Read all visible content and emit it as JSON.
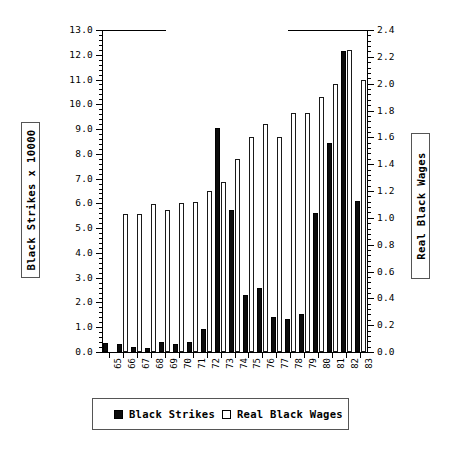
{
  "chart_data": {
    "type": "bar",
    "title": "",
    "subtitle": "",
    "xlabel": "",
    "ylabel": "Black Strikes x 10000",
    "ylabel_right": "Real Black Wages",
    "categories": [
      "65",
      "66",
      "67",
      "68",
      "69",
      "70",
      "71",
      "72",
      "73",
      "74",
      "75",
      "76",
      "77",
      "78",
      "79",
      "80",
      "81",
      "82",
      "83"
    ],
    "ylim": [
      0.0,
      13.0
    ],
    "ylim_right": [
      0.0,
      2.4
    ],
    "ytick_labels": [
      "0.0",
      "1.0",
      "2.0",
      "3.0",
      "4.0",
      "5.0",
      "6.0",
      "7.0",
      "8.0",
      "9.0",
      "10.0",
      "11.0",
      "12.0",
      "13.0"
    ],
    "ytick_values": [
      0,
      1,
      2,
      3,
      4,
      5,
      6,
      7,
      8,
      9,
      10,
      11,
      12,
      13
    ],
    "ytick_right_labels": [
      "0.0",
      "0.2",
      "0.4",
      "0.6",
      "0.8",
      "1.0",
      "1.2",
      "1.4",
      "1.6",
      "1.8",
      "2.0",
      "2.2",
      "2.4"
    ],
    "ytick_right_values": [
      0,
      0.2,
      0.4,
      0.6,
      0.8,
      1.0,
      1.2,
      1.4,
      1.6,
      1.8,
      2.0,
      2.2,
      2.4
    ],
    "minor_ticks_per_major": 5,
    "grid": false,
    "legend_position": "below-axes",
    "series": [
      {
        "name": "Black Strikes",
        "axis": "left",
        "color": "#0c0c0c",
        "style": "filled",
        "values": [
          0.35,
          0.33,
          0.22,
          0.15,
          0.42,
          0.33,
          0.4,
          0.92,
          9.05,
          5.75,
          2.3,
          2.6,
          1.42,
          1.35,
          1.52,
          5.6,
          8.45,
          12.15,
          6.1
        ]
      },
      {
        "name": "Real Black Wages",
        "axis": "right",
        "color": "#ffffff",
        "style": "hollow",
        "values": [
          null,
          1.03,
          1.03,
          1.1,
          1.06,
          1.11,
          1.12,
          1.2,
          1.27,
          1.44,
          1.6,
          1.7,
          1.6,
          1.78,
          1.78,
          1.9,
          2.0,
          2.25,
          2.03
        ]
      }
    ],
    "legend": [
      {
        "label": "Black Strikes",
        "swatch": "filled"
      },
      {
        "label": "Real Black Wages",
        "swatch": "hollow"
      }
    ]
  }
}
